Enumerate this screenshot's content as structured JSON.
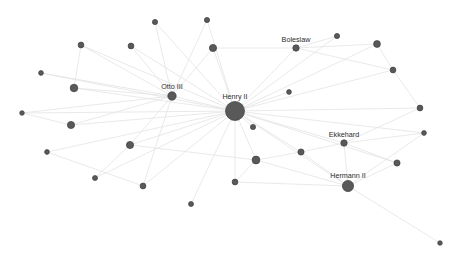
{
  "graph": {
    "title": "Network graph",
    "background_color": "#ffffff",
    "node_color": "#595959",
    "node_stroke_color": "#3d3d3d",
    "edge_color": "#e3e3e3",
    "label_color": "#2b2b2b",
    "width": 451,
    "height": 260,
    "nodes": [
      {
        "id": "henry-ii",
        "label": "Henry II",
        "x": 235,
        "y": 111,
        "r": 9.5,
        "label_dx": 0,
        "label_dy": -12
      },
      {
        "id": "otto-iii",
        "label": "Otto III",
        "x": 172,
        "y": 96,
        "r": 4.2,
        "label_dx": 0,
        "label_dy": -7
      },
      {
        "id": "boleslaw",
        "label": "Boleslaw",
        "x": 296,
        "y": 48,
        "r": 3.2,
        "label_dx": 0,
        "label_dy": -6
      },
      {
        "id": "ekkehard",
        "label": "Ekkehard",
        "x": 344,
        "y": 143,
        "r": 3.2,
        "label_dx": 0,
        "label_dy": -6
      },
      {
        "id": "hermann-ii",
        "label": "Hermann II",
        "x": 348,
        "y": 186,
        "r": 5.6,
        "label_dx": 0,
        "label_dy": -8
      },
      {
        "id": "n01",
        "label": "",
        "x": 155,
        "y": 22,
        "r": 2.6,
        "label_dx": 0,
        "label_dy": 0
      },
      {
        "id": "n02",
        "label": "",
        "x": 207,
        "y": 20,
        "r": 2.6,
        "label_dx": 0,
        "label_dy": 0
      },
      {
        "id": "n03",
        "label": "",
        "x": 213,
        "y": 48,
        "r": 3.6,
        "label_dx": 0,
        "label_dy": 0
      },
      {
        "id": "n04",
        "label": "",
        "x": 131,
        "y": 46,
        "r": 2.9,
        "label_dx": 0,
        "label_dy": 0
      },
      {
        "id": "n05",
        "label": "",
        "x": 81,
        "y": 45,
        "r": 2.9,
        "label_dx": 0,
        "label_dy": 0
      },
      {
        "id": "n06",
        "label": "",
        "x": 41,
        "y": 73,
        "r": 2.4,
        "label_dx": 0,
        "label_dy": 0
      },
      {
        "id": "n07",
        "label": "",
        "x": 74,
        "y": 88,
        "r": 3.8,
        "label_dx": 0,
        "label_dy": 0
      },
      {
        "id": "n08",
        "label": "",
        "x": 22,
        "y": 113,
        "r": 2.3,
        "label_dx": 0,
        "label_dy": 0
      },
      {
        "id": "n09",
        "label": "",
        "x": 71,
        "y": 125,
        "r": 3.6,
        "label_dx": 0,
        "label_dy": 0
      },
      {
        "id": "n10",
        "label": "",
        "x": 47,
        "y": 152,
        "r": 2.4,
        "label_dx": 0,
        "label_dy": 0
      },
      {
        "id": "n11",
        "label": "",
        "x": 130,
        "y": 145,
        "r": 3.6,
        "label_dx": 0,
        "label_dy": 0
      },
      {
        "id": "n12",
        "label": "",
        "x": 95,
        "y": 178,
        "r": 2.5,
        "label_dx": 0,
        "label_dy": 0
      },
      {
        "id": "n13",
        "label": "",
        "x": 143,
        "y": 186,
        "r": 2.9,
        "label_dx": 0,
        "label_dy": 0
      },
      {
        "id": "n14",
        "label": "",
        "x": 191,
        "y": 204,
        "r": 2.5,
        "label_dx": 0,
        "label_dy": 0
      },
      {
        "id": "n15",
        "label": "",
        "x": 235,
        "y": 182,
        "r": 2.9,
        "label_dx": 0,
        "label_dy": 0
      },
      {
        "id": "n16",
        "label": "",
        "x": 256,
        "y": 160,
        "r": 3.9,
        "label_dx": 0,
        "label_dy": 0
      },
      {
        "id": "n17",
        "label": "",
        "x": 253,
        "y": 127,
        "r": 2.6,
        "label_dx": 0,
        "label_dy": 0
      },
      {
        "id": "n18",
        "label": "",
        "x": 301,
        "y": 152,
        "r": 3.1,
        "label_dx": 0,
        "label_dy": 0
      },
      {
        "id": "n19",
        "label": "",
        "x": 397,
        "y": 163,
        "r": 3.1,
        "label_dx": 0,
        "label_dy": 0
      },
      {
        "id": "n20",
        "label": "",
        "x": 424,
        "y": 133,
        "r": 2.4,
        "label_dx": 0,
        "label_dy": 0
      },
      {
        "id": "n21",
        "label": "",
        "x": 420,
        "y": 108,
        "r": 2.9,
        "label_dx": 0,
        "label_dy": 0
      },
      {
        "id": "n22",
        "label": "",
        "x": 393,
        "y": 70,
        "r": 2.9,
        "label_dx": 0,
        "label_dy": 0
      },
      {
        "id": "n23",
        "label": "",
        "x": 377,
        "y": 44,
        "r": 3.4,
        "label_dx": 0,
        "label_dy": 0
      },
      {
        "id": "n24",
        "label": "",
        "x": 337,
        "y": 36,
        "r": 2.6,
        "label_dx": 0,
        "label_dy": 0
      },
      {
        "id": "n25",
        "label": "",
        "x": 440,
        "y": 243,
        "r": 2.3,
        "label_dx": 0,
        "label_dy": 0
      },
      {
        "id": "n26",
        "label": "",
        "x": 289,
        "y": 92,
        "r": 2.4,
        "label_dx": 0,
        "label_dy": 0
      }
    ],
    "edges": [
      {
        "source": "henry-ii",
        "target": "otto-iii"
      },
      {
        "source": "henry-ii",
        "target": "boleslaw"
      },
      {
        "source": "henry-ii",
        "target": "ekkehard"
      },
      {
        "source": "henry-ii",
        "target": "hermann-ii"
      },
      {
        "source": "henry-ii",
        "target": "n01"
      },
      {
        "source": "henry-ii",
        "target": "n02"
      },
      {
        "source": "henry-ii",
        "target": "n03"
      },
      {
        "source": "henry-ii",
        "target": "n04"
      },
      {
        "source": "henry-ii",
        "target": "n05"
      },
      {
        "source": "henry-ii",
        "target": "n06"
      },
      {
        "source": "henry-ii",
        "target": "n07"
      },
      {
        "source": "henry-ii",
        "target": "n08"
      },
      {
        "source": "henry-ii",
        "target": "n09"
      },
      {
        "source": "henry-ii",
        "target": "n10"
      },
      {
        "source": "henry-ii",
        "target": "n11"
      },
      {
        "source": "henry-ii",
        "target": "n12"
      },
      {
        "source": "henry-ii",
        "target": "n13"
      },
      {
        "source": "henry-ii",
        "target": "n14"
      },
      {
        "source": "henry-ii",
        "target": "n15"
      },
      {
        "source": "henry-ii",
        "target": "n16"
      },
      {
        "source": "henry-ii",
        "target": "n17"
      },
      {
        "source": "henry-ii",
        "target": "n18"
      },
      {
        "source": "henry-ii",
        "target": "n19"
      },
      {
        "source": "henry-ii",
        "target": "n20"
      },
      {
        "source": "henry-ii",
        "target": "n21"
      },
      {
        "source": "henry-ii",
        "target": "n22"
      },
      {
        "source": "henry-ii",
        "target": "n23"
      },
      {
        "source": "henry-ii",
        "target": "n24"
      },
      {
        "source": "henry-ii",
        "target": "n26"
      },
      {
        "source": "otto-iii",
        "target": "n05"
      },
      {
        "source": "otto-iii",
        "target": "n04"
      },
      {
        "source": "otto-iii",
        "target": "n07"
      },
      {
        "source": "otto-iii",
        "target": "n09"
      },
      {
        "source": "otto-iii",
        "target": "n11"
      },
      {
        "source": "otto-iii",
        "target": "n03"
      },
      {
        "source": "otto-iii",
        "target": "n01"
      },
      {
        "source": "otto-iii",
        "target": "n02"
      },
      {
        "source": "otto-iii",
        "target": "n06"
      },
      {
        "source": "otto-iii",
        "target": "n08"
      },
      {
        "source": "otto-iii",
        "target": "n13"
      },
      {
        "source": "boleslaw",
        "target": "n24"
      },
      {
        "source": "boleslaw",
        "target": "n23"
      },
      {
        "source": "boleslaw",
        "target": "n22"
      },
      {
        "source": "boleslaw",
        "target": "n03"
      },
      {
        "source": "ekkehard",
        "target": "hermann-ii"
      },
      {
        "source": "ekkehard",
        "target": "n19"
      },
      {
        "source": "ekkehard",
        "target": "n21"
      },
      {
        "source": "ekkehard",
        "target": "n18"
      },
      {
        "source": "ekkehard",
        "target": "n20"
      },
      {
        "source": "hermann-ii",
        "target": "n19"
      },
      {
        "source": "hermann-ii",
        "target": "n18"
      },
      {
        "source": "hermann-ii",
        "target": "n16"
      },
      {
        "source": "hermann-ii",
        "target": "n15"
      },
      {
        "source": "hermann-ii",
        "target": "n25"
      },
      {
        "source": "hermann-ii",
        "target": "n20"
      },
      {
        "source": "n16",
        "target": "n18"
      },
      {
        "source": "n16",
        "target": "n15"
      },
      {
        "source": "n16",
        "target": "n11"
      },
      {
        "source": "n07",
        "target": "n05"
      },
      {
        "source": "n09",
        "target": "n08"
      },
      {
        "source": "n11",
        "target": "n12"
      },
      {
        "source": "n13",
        "target": "n10"
      },
      {
        "source": "n22",
        "target": "n21"
      },
      {
        "source": "n23",
        "target": "n22"
      }
    ]
  }
}
